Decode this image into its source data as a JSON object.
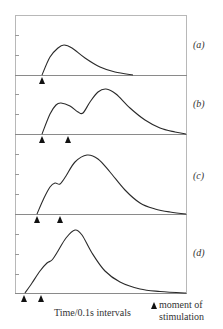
{
  "chart_data": {
    "type": "line",
    "title": "",
    "xlabel": "Time/0.1s intervals",
    "ylabel": "",
    "legend": [
      {
        "symbol": "filled-triangle",
        "label": "moment of stimulation"
      }
    ],
    "grid": false,
    "panels": [
      {
        "label": "(a)",
        "stimulations_x": [
          42
        ],
        "description": "Single twitch: one stimulus, single peak then decay",
        "points": [
          [
            42,
            0
          ],
          [
            50,
            18
          ],
          [
            58,
            27
          ],
          [
            64,
            30
          ],
          [
            72,
            27
          ],
          [
            85,
            17
          ],
          [
            100,
            8
          ],
          [
            115,
            3
          ],
          [
            133,
            0
          ]
        ]
      },
      {
        "label": "(b)",
        "stimulations_x": [
          42,
          68
        ],
        "description": "Two stimuli well separated: two distinct peaks (summation)",
        "points": [
          [
            42,
            0
          ],
          [
            50,
            20
          ],
          [
            56,
            29
          ],
          [
            61,
            31
          ],
          [
            70,
            28
          ],
          [
            78,
            22
          ],
          [
            83,
            21
          ],
          [
            90,
            32
          ],
          [
            98,
            42
          ],
          [
            106,
            45
          ],
          [
            116,
            40
          ],
          [
            130,
            26
          ],
          [
            145,
            14
          ],
          [
            160,
            6
          ],
          [
            175,
            2
          ],
          [
            186,
            0
          ]
        ]
      },
      {
        "label": "(c)",
        "stimulations_x": [
          37,
          60
        ],
        "description": "Two stimuli closer together: shoulder then higher summed peak",
        "points": [
          [
            37,
            0
          ],
          [
            44,
            16
          ],
          [
            50,
            27
          ],
          [
            55,
            31
          ],
          [
            60,
            30
          ],
          [
            66,
            38
          ],
          [
            75,
            52
          ],
          [
            87,
            59
          ],
          [
            98,
            55
          ],
          [
            110,
            42
          ],
          [
            125,
            24
          ],
          [
            140,
            11
          ],
          [
            155,
            5
          ],
          [
            170,
            2
          ],
          [
            186,
            0
          ]
        ]
      },
      {
        "label": "(d)",
        "stimulations_x": [
          24,
          41
        ],
        "description": "Two stimuli very close: small shoulder merging into a single large peak",
        "points": [
          [
            25,
            0
          ],
          [
            32,
            10
          ],
          [
            40,
            22
          ],
          [
            47,
            30
          ],
          [
            52,
            33
          ],
          [
            58,
            42
          ],
          [
            66,
            55
          ],
          [
            75,
            63
          ],
          [
            82,
            58
          ],
          [
            92,
            40
          ],
          [
            105,
            22
          ],
          [
            120,
            11
          ],
          [
            140,
            4
          ],
          [
            160,
            1.5
          ],
          [
            186,
            0
          ]
        ]
      }
    ],
    "y_ticks_per_panel": 2,
    "units_note": "y in pixel-height above each panel baseline (unlabeled arbitrary tension axis)"
  },
  "figure": {
    "panel_labels": [
      "(a)",
      "(b)",
      "(c)",
      "(d)"
    ],
    "x_axis_label": "Time/0.1s intervals",
    "legend_line1": "moment of",
    "legend_line2": "stimulation"
  }
}
